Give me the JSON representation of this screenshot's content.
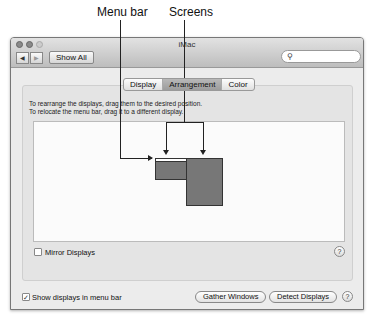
{
  "callouts": {
    "menu_bar": "Menu bar",
    "screens": "Screens"
  },
  "window": {
    "title": "iMac",
    "nav_back_icon": "◀",
    "nav_forward_icon": "▶",
    "show_all": "Show All",
    "search": {
      "placeholder": "",
      "icon": "⚲"
    }
  },
  "tabs": [
    {
      "label": "Display",
      "active": false
    },
    {
      "label": "Arrangement",
      "active": true
    },
    {
      "label": "Color",
      "active": false
    }
  ],
  "instructions": {
    "line1": "To rearrange the displays, drag them to the desired position.",
    "line2": "To relocate the menu bar, drag it to a different display."
  },
  "mirror_displays": {
    "label": "Mirror Displays",
    "checked": false
  },
  "show_in_menu_bar": {
    "label": "Show displays in menu bar",
    "checked": true,
    "check_glyph": "✓"
  },
  "buttons": {
    "gather_windows": "Gather Windows",
    "detect_displays": "Detect Displays"
  },
  "help_glyph": "?"
}
